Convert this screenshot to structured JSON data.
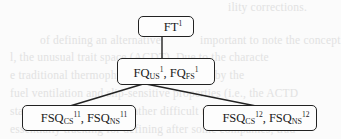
{
  "background_text": {
    "lines": [
      {
        "text": "ility corrections.",
        "x": 228,
        "y": 1
      },
      {
        "text": "of defining an alternative",
        "x": 40,
        "y": 34
      },
      {
        "text": "important to note the concept",
        "x": 200,
        "y": 34
      },
      {
        "text": "l, the unusual trait space (ACDT). Due to the characte",
        "x": 10,
        "y": 51
      },
      {
        "text": "e traditional thermophysical characterized by the",
        "x": 10,
        "y": 69
      },
      {
        "text": "fuel ventilation and slip-sensitive properties (i.e., the ACTD",
        "x": 10,
        "y": 87
      },
      {
        "text": "stand has its operational rather difficult to expressed in terms",
        "x": 10,
        "y": 105
      },
      {
        "text": "essentially tracking for defining after some companies, trad",
        "x": 10,
        "y": 123
      }
    ]
  },
  "diagram": {
    "nodes": {
      "root": {
        "base": "FT",
        "sup": "1"
      },
      "middle": {
        "part1": {
          "base": "FQ",
          "sub": "US",
          "sup": "1"
        },
        "separator": ", ",
        "part2": {
          "base": "FQ",
          "sub": "FS",
          "sup": "1"
        }
      },
      "left_child": {
        "part1": {
          "base": "FSQ",
          "sub": "CS",
          "sup": "11"
        },
        "separator": ", ",
        "part2": {
          "base": "FSQ",
          "sub": "NS",
          "sup": "11"
        }
      },
      "right_child": {
        "part1": {
          "base": "FSQ",
          "sub": "CS",
          "sup": "12"
        },
        "separator": ", ",
        "part2": {
          "base": "FSQ",
          "sub": "NS",
          "sup": "12"
        }
      }
    },
    "edges": [
      {
        "from": "root",
        "to": "middle"
      },
      {
        "from": "middle",
        "to": "left_child"
      },
      {
        "from": "middle",
        "to": "right_child"
      }
    ],
    "colors": {
      "stroke": "#222222",
      "background": "#fbfbfb",
      "ghost_text": "#e2e2e2"
    }
  }
}
